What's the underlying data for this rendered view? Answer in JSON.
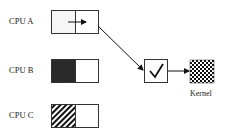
{
  "diagram": {
    "cpus": [
      {
        "label": "CPU A",
        "state": "arrow"
      },
      {
        "label": "CPU B",
        "state": "dense-hatch"
      },
      {
        "label": "CPU C",
        "state": "diagonal-hatch"
      }
    ],
    "check_node": {
      "icon": "checkmark-icon",
      "symbol": "✓"
    },
    "kernel": {
      "label": "Kernel",
      "pattern": "checkerboard"
    },
    "colors": {
      "stroke": "#333333",
      "fill_light": "#f4f4f4",
      "dark": "#222222"
    }
  }
}
